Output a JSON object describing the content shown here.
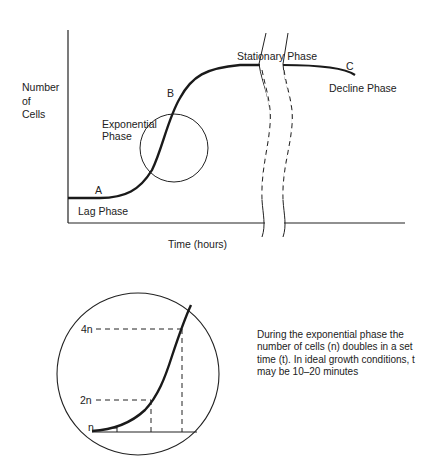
{
  "growth_curve": {
    "y_axis_label_lines": [
      "Number",
      "of",
      "Cells"
    ],
    "x_axis_label": "Time (hours)",
    "points": {
      "a": "A",
      "b": "B",
      "c": "C"
    },
    "phases": {
      "lag": "Lag Phase",
      "exponential_lines": [
        "Exponential",
        "Phase"
      ],
      "stationary": "Stationary Phase",
      "decline": "Decline Phase"
    }
  },
  "inset": {
    "y_labels": {
      "n": "n",
      "two_n": "2n",
      "four_n": "4n"
    },
    "description": "During the exponential phase the number of cells (n) doubles in a set time (t). In ideal growth conditions, t may be 10–20 minutes"
  },
  "colors": {
    "line": "#1a1a1a",
    "background": "#ffffff"
  }
}
